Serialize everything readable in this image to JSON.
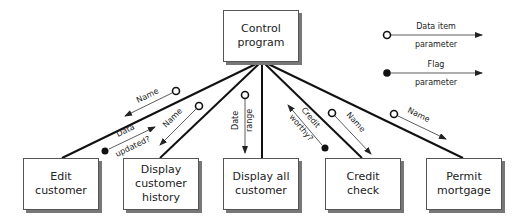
{
  "modules": {
    "root": "Control\nprogram",
    "edit": "Edit\ncustomer",
    "history": "Display\ncustomer\nhistory",
    "all": "Display all\ncustomer",
    "credit": "Credit\ncheck",
    "permit": "Permit\nmortgage"
  },
  "params": {
    "edit_name": "Name",
    "edit_flag_1": "Data",
    "edit_flag_2": "updated?",
    "history_name": "Name",
    "all_date_1": "Date",
    "all_date_2": "range",
    "credit_flag_1": "Credit",
    "credit_flag_2": "worthy?",
    "credit_name": "Name",
    "permit_name": "Name"
  },
  "legend": {
    "data_item_top": "Data item",
    "data_item_bottom": "parameter",
    "flag_top": "Flag",
    "flag_bottom": "parameter"
  }
}
